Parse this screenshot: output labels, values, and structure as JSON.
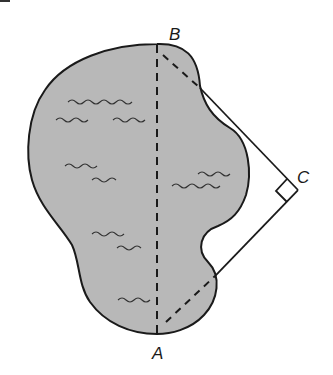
{
  "diagram": {
    "type": "geometry-figure",
    "colors": {
      "lake_fill": "#b8b8b8",
      "outline": "#1a1a1a",
      "background": "#ffffff",
      "waves": "#333333"
    },
    "points": [
      {
        "label": "A",
        "x": 157,
        "y": 333
      },
      {
        "label": "B",
        "x": 157,
        "y": 45
      },
      {
        "label": "C",
        "x": 298,
        "y": 190
      }
    ],
    "labels": {
      "A": "A",
      "B": "B",
      "C": "C"
    },
    "segments": [
      {
        "from": "A",
        "to": "B",
        "style": "dashed",
        "note": "distance across lake"
      },
      {
        "from": "B",
        "to": "C",
        "style": "dashed inside lake, solid outside"
      },
      {
        "from": "A",
        "to": "C",
        "style": "dashed inside lake, solid outside"
      }
    ],
    "right_angle_at": "C"
  }
}
